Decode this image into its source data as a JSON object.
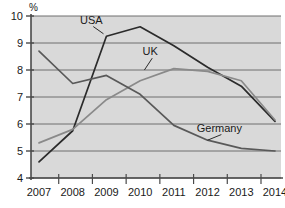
{
  "chart_data": {
    "type": "line",
    "title": "",
    "subtitle": "",
    "xlabel": "",
    "ylabel": "%",
    "unit_label": "%",
    "categories": [
      "2007",
      "2008",
      "2009",
      "2010",
      "2011",
      "2012",
      "2013",
      "2014"
    ],
    "x": [
      2007,
      2008,
      2009,
      2010,
      2011,
      2012,
      2013,
      2014
    ],
    "xlim": [
      2007,
      2014
    ],
    "ylim": [
      4,
      10
    ],
    "yticks": [
      "10",
      "9",
      "8",
      "7",
      "6",
      "5",
      "4"
    ],
    "ytick_values": [
      10,
      9,
      8,
      7,
      6,
      5,
      4
    ],
    "grid": true,
    "legend": "inline-labels",
    "legend_position": "inline",
    "series": [
      {
        "name": "USA",
        "color": "#2b2b2b",
        "values": [
          4.6,
          5.75,
          9.25,
          9.6,
          8.9,
          8.1,
          7.4,
          6.1
        ]
      },
      {
        "name": "UK",
        "color": "#8a8a8a",
        "values": [
          5.3,
          5.8,
          6.9,
          7.6,
          8.05,
          7.95,
          7.6,
          6.15
        ]
      },
      {
        "name": "Germany",
        "color": "#595959",
        "values": [
          8.7,
          7.5,
          7.8,
          7.1,
          5.95,
          5.4,
          5.1,
          5.0
        ]
      }
    ],
    "annotations": [
      {
        "text": "USA",
        "series": "USA",
        "x": 2008.55,
        "y": 9.72
      },
      {
        "text": "UK",
        "series": "UK",
        "x": 2010.3,
        "y": 8.55
      },
      {
        "text": "Germany",
        "series": "Germany",
        "x": 2012.35,
        "y": 5.72
      }
    ],
    "colors": {
      "plot_background": "#d9d9d9",
      "page_background": "#ffffff",
      "gridline": "#6e6e6e",
      "axis": "#4a4a4a",
      "text": "#1a1a1a"
    }
  }
}
